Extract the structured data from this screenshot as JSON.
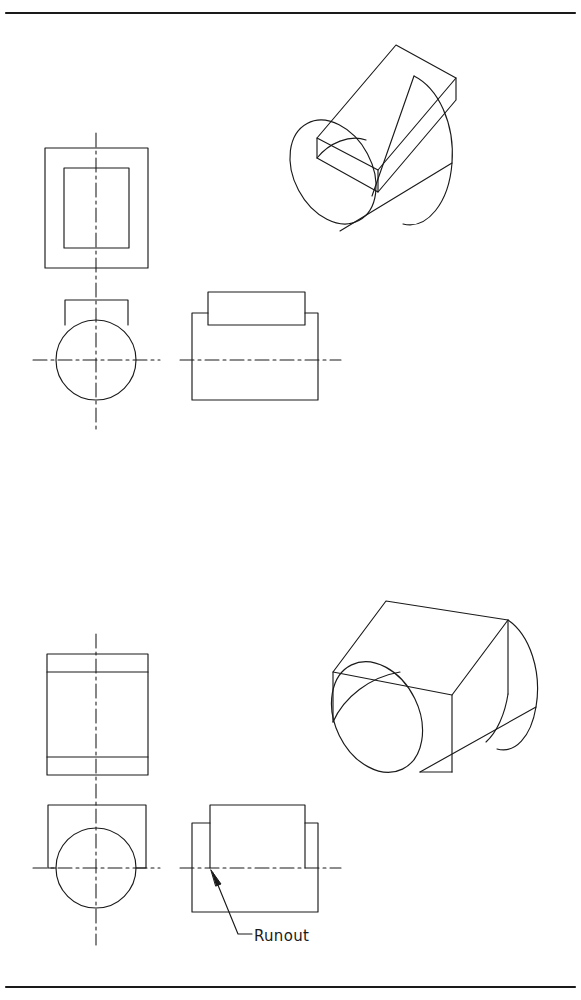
{
  "sheet": {
    "width": 581,
    "height": 1000,
    "background": "#ffffff",
    "line_color": "#1a1a1a",
    "border": {
      "top_rule_y": 13,
      "bottom_rule_y": 987,
      "stroke_width": 2.2
    }
  },
  "annotations": {
    "runout_label": "Runout"
  },
  "figures": [
    {
      "id": "figure-top",
      "caption_label": "",
      "description": "Cylinder with narrow rectangular boss - tangent, no runout",
      "views": {
        "top_view": {
          "outer_rect": {
            "x": 45,
            "y": 148,
            "w": 103,
            "h": 120
          },
          "inner_rect": {
            "x": 64,
            "y": 168,
            "w": 65,
            "h": 80
          }
        },
        "front_view": {
          "circle": {
            "cx": 96,
            "cy": 360,
            "r": 40
          },
          "boss_rect": {
            "x": 65,
            "y": 300,
            "w": 63,
            "h": 33
          }
        },
        "side_view": {
          "body_rect": {
            "x": 192,
            "y": 313,
            "w": 126,
            "h": 87
          },
          "boss_rect": {
            "x": 208,
            "y": 292,
            "w": 97,
            "h": 33
          }
        },
        "pictorial": {
          "type": "isometric",
          "shape": "cylinder-with-narrow-boss"
        }
      }
    },
    {
      "id": "figure-bottom",
      "caption_label": "Runout",
      "description": "Cylinder with wide rectangular boss - intersection produces runout",
      "views": {
        "top_view": {
          "outer_rect": {
            "x": 47,
            "y": 654,
            "w": 101,
            "h": 121
          },
          "line_upper_y": 672,
          "line_lower_y": 757
        },
        "front_view": {
          "circle": {
            "cx": 96,
            "cy": 868,
            "r": 40
          },
          "square_rect": {
            "x": 48,
            "y": 805,
            "w": 98,
            "h": 120
          }
        },
        "side_view": {
          "body_rect": {
            "x": 192,
            "y": 823,
            "w": 126,
            "h": 89
          },
          "boss_rect": {
            "x": 210,
            "y": 805,
            "w": 95,
            "h": 63
          }
        },
        "pictorial": {
          "type": "isometric",
          "shape": "cylinder-with-wide-boss-runout"
        }
      },
      "leader": {
        "arrow_tip": {
          "x": 212,
          "y": 872
        },
        "elbow": {
          "x": 238,
          "y": 934
        },
        "text_anchor": {
          "x": 253,
          "y": 940
        }
      }
    }
  ],
  "centerlines": {
    "dash_pattern": "14 4 3 4",
    "top_vertical_x": 96,
    "top_vertical_from": 133,
    "top_vertical_to": 433,
    "top_horizontal_y": 360,
    "bottom_vertical_x": 96,
    "bottom_vertical_from": 634,
    "bottom_vertical_to": 945,
    "bottom_horizontal_y": 868
  }
}
